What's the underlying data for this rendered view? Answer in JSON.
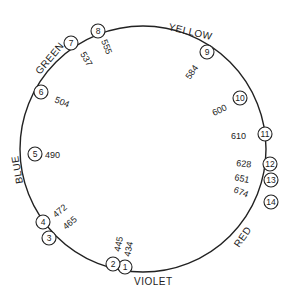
{
  "diagram": {
    "type": "color-circle",
    "regions": [
      {
        "label": "YELLOW"
      },
      {
        "label": "GREEN"
      },
      {
        "label": "BLUE"
      },
      {
        "label": "VIOLET"
      },
      {
        "label": "RED"
      }
    ],
    "points": [
      {
        "id": "1",
        "wavelength": "434"
      },
      {
        "id": "2",
        "wavelength": "445"
      },
      {
        "id": "3",
        "wavelength": "465"
      },
      {
        "id": "4",
        "wavelength": "472"
      },
      {
        "id": "5",
        "wavelength": "490"
      },
      {
        "id": "6",
        "wavelength": "504"
      },
      {
        "id": "7",
        "wavelength": "537"
      },
      {
        "id": "8",
        "wavelength": "555"
      },
      {
        "id": "9",
        "wavelength": "584"
      },
      {
        "id": "10",
        "wavelength": "600"
      },
      {
        "id": "11",
        "wavelength": "610"
      },
      {
        "id": "12",
        "wavelength": "628"
      },
      {
        "id": "13",
        "wavelength": "651"
      },
      {
        "id": "14",
        "wavelength": "674"
      }
    ],
    "colors": {
      "line": "#222222",
      "background": "#ffffff"
    }
  }
}
